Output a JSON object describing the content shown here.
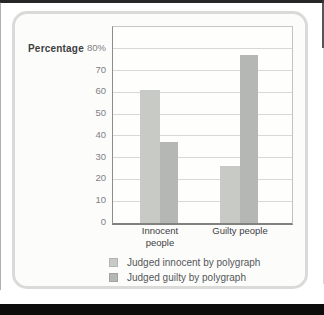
{
  "chart_data": {
    "type": "bar",
    "title": "",
    "ylabel": "Percentage",
    "categories": [
      "Innocent people",
      "Guilty people"
    ],
    "series": [
      {
        "name": "Judged innocent by polygraph",
        "color": "#c8cac5",
        "values": [
          61,
          26
        ]
      },
      {
        "name": "Judged guilty by polygraph",
        "color": "#b5b7b4",
        "values": [
          37,
          77
        ]
      }
    ],
    "y_ticks": [
      0,
      10,
      20,
      30,
      40,
      50,
      60,
      70,
      80
    ],
    "y_tick_labels": [
      "0",
      "10",
      "20",
      "30",
      "40",
      "50",
      "60",
      "70",
      "80%"
    ],
    "ylim": [
      0,
      90
    ],
    "grid": true,
    "legend_position": "bottom",
    "legend": [
      "Judged innocent by polygraph",
      "Judged guilty by polygraph"
    ]
  }
}
